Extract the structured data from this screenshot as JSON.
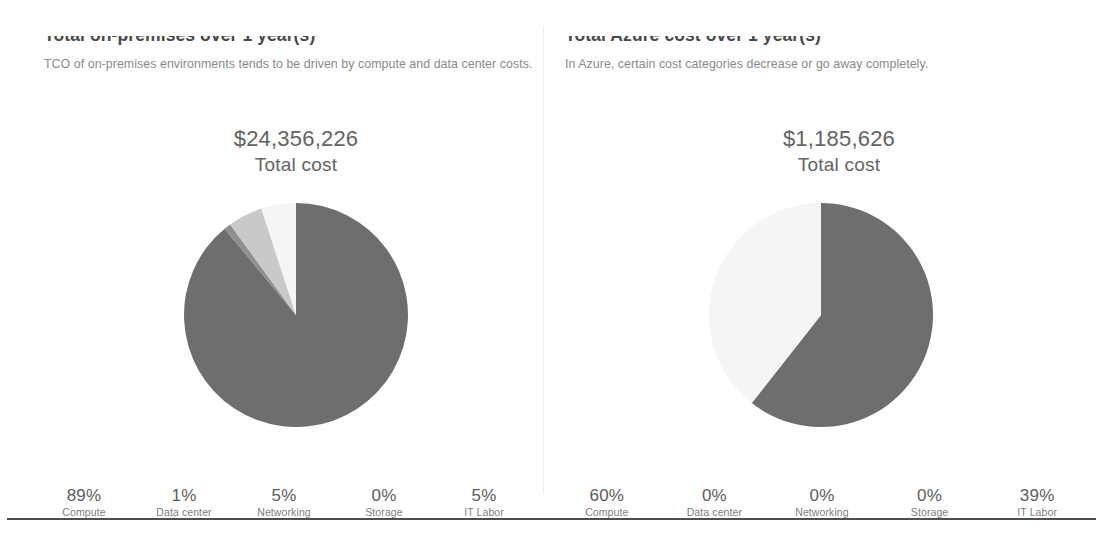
{
  "panels": [
    {
      "id": "on-premises",
      "title": "Total on-premises over 1 year(s)",
      "subtitle": "TCO of on-premises environments tends to be driven by compute and data center costs.",
      "total_amount": "$24,356,226",
      "total_label": "Total cost",
      "legend": [
        {
          "pct": "89%",
          "name": "Compute"
        },
        {
          "pct": "1%",
          "name": "Data center"
        },
        {
          "pct": "5%",
          "name": "Networking"
        },
        {
          "pct": "0%",
          "name": "Storage"
        },
        {
          "pct": "5%",
          "name": "IT Labor"
        }
      ]
    },
    {
      "id": "azure",
      "title": "Total Azure cost over 1 year(s)",
      "subtitle": "In Azure, certain cost categories decrease or go away completely.",
      "total_amount": "$1,185,626",
      "total_label": "Total cost",
      "legend": [
        {
          "pct": "60%",
          "name": "Compute"
        },
        {
          "pct": "0%",
          "name": "Data center"
        },
        {
          "pct": "0%",
          "name": "Networking"
        },
        {
          "pct": "0%",
          "name": "Storage"
        },
        {
          "pct": "39%",
          "name": "IT Labor"
        }
      ]
    }
  ],
  "colors": {
    "compute": "#6e6e6e",
    "data_center": "#8f8f8f",
    "networking": "#c9c9c9",
    "storage": "#e2e2e2",
    "it_labor": "#f5f5f5",
    "text_primary": "#4a4a4a",
    "text_secondary": "#8a8a8a",
    "rule": "#4f4f4f",
    "divider": "#ededed"
  },
  "chart_data": [
    {
      "type": "pie",
      "title": "Total on-premises over 1 year(s)",
      "subtitle": "TCO of on-premises environments tends to be driven by compute and data center costs.",
      "center_label": "$24,356,226 Total cost",
      "total": 24356226,
      "total_formatted": "$24,356,226",
      "categories": [
        "Compute",
        "Data center",
        "Networking",
        "Storage",
        "IT Labor"
      ],
      "values": [
        89,
        1,
        5,
        0,
        5
      ],
      "value_labels": [
        "89%",
        "1%",
        "5%",
        "0%",
        "5%"
      ],
      "units": "percent",
      "colors": [
        "#6e6e6e",
        "#8f8f8f",
        "#c9c9c9",
        "#e2e2e2",
        "#f5f5f5"
      ],
      "start_angle_deg": 0,
      "direction": "clockwise",
      "legend_position": "bottom",
      "grid": false
    },
    {
      "type": "pie",
      "title": "Total Azure cost over 1 year(s)",
      "subtitle": "In Azure, certain cost categories decrease or go away completely.",
      "center_label": "$1,185,626 Total cost",
      "total": 1185626,
      "total_formatted": "$1,185,626",
      "categories": [
        "Compute",
        "Data center",
        "Networking",
        "Storage",
        "IT Labor"
      ],
      "values": [
        60,
        0,
        0,
        0,
        39
      ],
      "value_labels": [
        "60%",
        "0%",
        "0%",
        "0%",
        "39%"
      ],
      "units": "percent",
      "colors": [
        "#6e6e6e",
        "#8f8f8f",
        "#c9c9c9",
        "#e2e2e2",
        "#f5f5f5"
      ],
      "start_angle_deg": 0,
      "direction": "clockwise",
      "legend_position": "bottom",
      "grid": false
    }
  ]
}
